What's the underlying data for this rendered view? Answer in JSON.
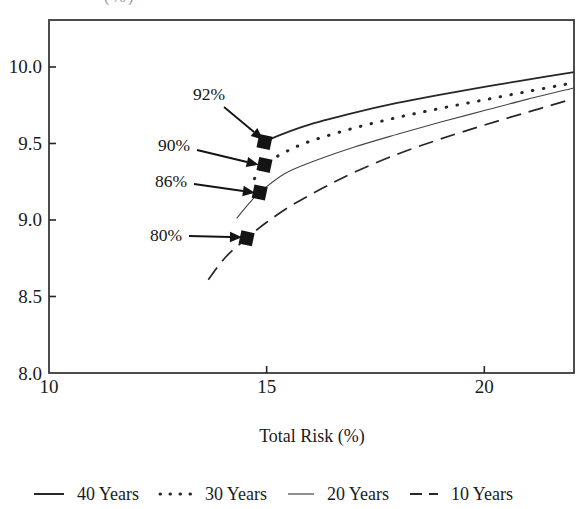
{
  "top_cut_text": "(%)",
  "chart_data": {
    "type": "line",
    "title": "",
    "xlabel": "Total Risk (%)",
    "ylabel": "",
    "xlim": [
      10,
      22.06
    ],
    "ylim": [
      8.0,
      10.307
    ],
    "grid": false,
    "legend_position": "bottom",
    "x_ticks": [
      {
        "value": 10,
        "label": "10"
      },
      {
        "value": 15,
        "label": "15"
      },
      {
        "value": 20,
        "label": "20"
      }
    ],
    "y_ticks": [
      {
        "value": 8.0,
        "label": "8.0"
      },
      {
        "value": 8.5,
        "label": "8.5"
      },
      {
        "value": 9.0,
        "label": "9.0"
      },
      {
        "value": 9.5,
        "label": "9.5"
      },
      {
        "value": 10.0,
        "label": "10.0"
      }
    ],
    "series": [
      {
        "name": "40 Years",
        "style": "solid",
        "points": [
          [
            14.95,
            9.51
          ],
          [
            15.3,
            9.555
          ],
          [
            16,
            9.625
          ],
          [
            17,
            9.7
          ],
          [
            18,
            9.765
          ],
          [
            19,
            9.82
          ],
          [
            20,
            9.87
          ],
          [
            21,
            9.917
          ],
          [
            22.06,
            9.967
          ]
        ]
      },
      {
        "name": "30 Years",
        "style": "dotted",
        "points": [
          [
            14.72,
            9.27
          ],
          [
            14.95,
            9.36
          ],
          [
            15.4,
            9.44
          ],
          [
            16,
            9.515
          ],
          [
            17,
            9.6
          ],
          [
            18,
            9.67
          ],
          [
            19,
            9.73
          ],
          [
            20,
            9.785
          ],
          [
            21,
            9.84
          ],
          [
            22.02,
            9.895
          ]
        ]
      },
      {
        "name": "20 Years",
        "style": "thin-solid",
        "points": [
          [
            14.31,
            9.01
          ],
          [
            14.6,
            9.11
          ],
          [
            14.84,
            9.18
          ],
          [
            15.4,
            9.3
          ],
          [
            16,
            9.375
          ],
          [
            17,
            9.475
          ],
          [
            18,
            9.56
          ],
          [
            19,
            9.64
          ],
          [
            20,
            9.715
          ],
          [
            21,
            9.79
          ],
          [
            22.06,
            9.863
          ]
        ]
      },
      {
        "name": "10 Years",
        "style": "dashed",
        "points": [
          [
            13.66,
            8.61
          ],
          [
            14.05,
            8.755
          ],
          [
            14.54,
            8.88
          ],
          [
            15,
            8.985
          ],
          [
            15.6,
            9.1
          ],
          [
            16.3,
            9.21
          ],
          [
            17,
            9.31
          ],
          [
            18,
            9.43
          ],
          [
            19,
            9.53
          ],
          [
            20,
            9.62
          ],
          [
            21,
            9.705
          ],
          [
            21.9,
            9.78
          ]
        ]
      }
    ],
    "annotations": [
      {
        "label": "92%",
        "point": [
          14.95,
          9.51
        ],
        "label_px": [
          209,
          94
        ],
        "arrow_px": [
          [
            224,
            107
          ],
          [
            254,
            132
          ]
        ]
      },
      {
        "label": "90%",
        "point": [
          14.95,
          9.36
        ],
        "label_px": [
          174,
          145
        ],
        "arrow_px": [
          [
            197,
            150
          ],
          [
            247,
            162
          ]
        ]
      },
      {
        "label": "86%",
        "point": [
          14.84,
          9.18
        ],
        "label_px": [
          171,
          181
        ],
        "arrow_px": [
          [
            194,
            184
          ],
          [
            243,
            191
          ]
        ]
      },
      {
        "label": "80%",
        "point": [
          14.54,
          8.88
        ],
        "label_px": [
          166,
          235
        ],
        "arrow_px": [
          [
            189,
            236
          ],
          [
            230,
            237
          ]
        ]
      }
    ],
    "legend": [
      {
        "label": "40 Years",
        "style": "solid"
      },
      {
        "label": "30 Years",
        "style": "dotted"
      },
      {
        "label": "20 Years",
        "style": "thin-solid"
      },
      {
        "label": "10 Years",
        "style": "dashed"
      }
    ]
  }
}
